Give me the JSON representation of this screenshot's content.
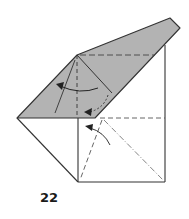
{
  "diagram": {
    "step_number": "22",
    "colors": {
      "paper_colored": "#b3b3b3",
      "paper_white": "#ffffff",
      "line": "#333333",
      "arrow": "#222222"
    },
    "elements": [
      "colored-flap",
      "white-square-base",
      "left-triangle-flap",
      "valley-fold-lines",
      "mountain-fold-lines",
      "fold-arrows"
    ]
  }
}
